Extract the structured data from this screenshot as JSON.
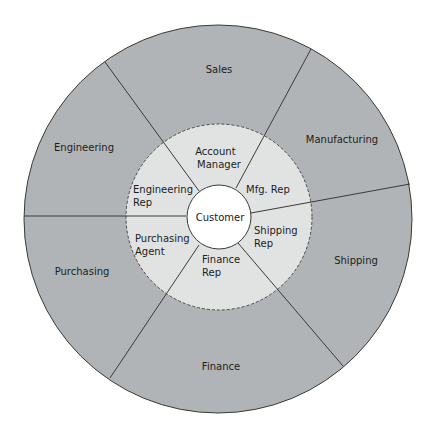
{
  "diagram": {
    "title": "",
    "center": {
      "label": "Customer"
    },
    "inner_ring": [
      {
        "id": "account-manager",
        "lines": [
          "Account",
          "Manager"
        ]
      },
      {
        "id": "mfg-rep",
        "lines": [
          "Mfg. Rep"
        ]
      },
      {
        "id": "shipping-rep",
        "lines": [
          "Shipping",
          "Rep"
        ]
      },
      {
        "id": "finance-rep",
        "lines": [
          "Finance",
          "Rep"
        ]
      },
      {
        "id": "purchasing-agent",
        "lines": [
          "Purchasing",
          "Agent"
        ]
      },
      {
        "id": "engineering-rep",
        "lines": [
          "Engineering",
          "Rep"
        ]
      }
    ],
    "outer_ring": [
      {
        "id": "sales",
        "label": "Sales"
      },
      {
        "id": "manufacturing",
        "label": "Manufacturing"
      },
      {
        "id": "shipping",
        "label": "Shipping"
      },
      {
        "id": "finance",
        "label": "Finance"
      },
      {
        "id": "purchasing",
        "label": "Purchasing"
      },
      {
        "id": "engineering",
        "label": "Engineering"
      }
    ],
    "colors": {
      "outer_fill": "#b1b4b6",
      "inner_fill": "#e1e3e3",
      "center_fill": "#ffffff",
      "stroke": "#3a3a3a"
    }
  }
}
